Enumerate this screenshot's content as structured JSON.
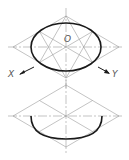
{
  "figure": {
    "top_view": {
      "labels": {
        "origin": "O",
        "x_axis": "X",
        "y_axis": "Y"
      },
      "rhombus": {
        "top": [
          66,
          16
        ],
        "left": [
          13,
          47
        ],
        "right": [
          119,
          47
        ],
        "bottom": [
          66,
          78
        ]
      },
      "ellipse": {
        "cx": 66,
        "cy": 47,
        "rx": 35,
        "ry": 24
      }
    },
    "bottom_view": {
      "rhombus": {
        "top": [
          66,
          85
        ],
        "left": [
          13,
          116
        ],
        "right": [
          119,
          116
        ],
        "bottom": [
          66,
          147
        ]
      },
      "half_ellipse": {
        "from": [
          31,
          116
        ],
        "to": [
          102,
          116
        ],
        "lowest": [
          66,
          139
        ]
      }
    },
    "colors": {
      "construction": "#9a9a9a",
      "outline": "#1a1a1a",
      "label": "#555555"
    }
  }
}
